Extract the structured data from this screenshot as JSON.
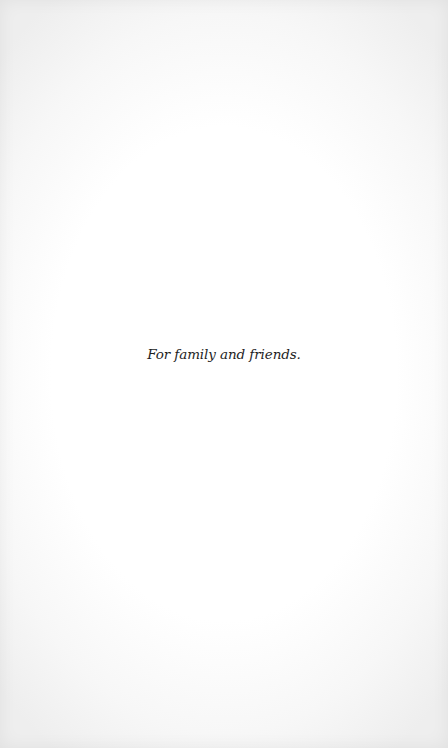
{
  "page": {
    "dedication": "For family and friends.",
    "background_color": "#ffffff",
    "text_color": "#1e1e1e"
  }
}
